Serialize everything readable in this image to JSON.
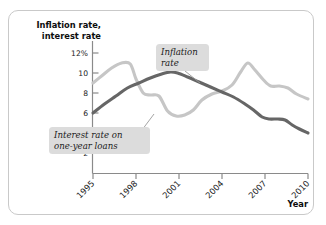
{
  "figure": {
    "frame_color": "#c9c9c9",
    "background": "#ffffff"
  },
  "chart_data": {
    "type": "line",
    "title": "",
    "ylabel_line1": "Inflation rate,",
    "ylabel_line2": "interest rate",
    "xlabel": "Year",
    "grid": false,
    "legend": "annotations",
    "xlim": [
      1995,
      2010
    ],
    "ylim": [
      0,
      12
    ],
    "ytick_labels": [
      "12%",
      "10",
      "8",
      "6",
      "4",
      "2"
    ],
    "ytick_values": [
      12,
      10,
      8,
      6,
      4,
      2
    ],
    "xtick_labels": [
      "1995",
      "1998",
      "2001",
      "2004",
      "2007",
      "2010"
    ],
    "xtick_values": [
      1995,
      1998,
      2001,
      2004,
      2007,
      2010
    ],
    "series": [
      {
        "name": "Inflation rate",
        "color": "#c6c6c6",
        "x": [
          1995,
          1995.6,
          1996.3,
          1997.0,
          1997.6,
          1998.0,
          1998.5,
          1999.0,
          1999.6,
          2000.2,
          2000.8,
          2001.4,
          2002.0,
          2002.6,
          2003.3,
          2004.0,
          2004.7,
          2005.3,
          2005.8,
          2006.3,
          2006.9,
          2007.4,
          2008.0,
          2008.6,
          2009.2,
          2010.0
        ],
        "values": [
          9.0,
          9.7,
          10.5,
          11.0,
          10.9,
          9.4,
          8.0,
          7.8,
          7.7,
          6.2,
          5.7,
          5.8,
          6.3,
          7.3,
          7.9,
          8.2,
          8.8,
          10.1,
          11.0,
          10.3,
          9.3,
          8.7,
          8.7,
          8.5,
          7.9,
          7.4
        ]
      },
      {
        "name": "Interest rate on one-year loans",
        "color": "#666666",
        "x": [
          1995,
          1995.8,
          1996.6,
          1997.4,
          1998.2,
          1999.0,
          1999.8,
          2000.4,
          2000.9,
          2001.6,
          2002.4,
          2003.2,
          2004.0,
          2004.8,
          2005.6,
          2006.2,
          2006.8,
          2007.3,
          2007.9,
          2008.4,
          2008.9,
          2009.4,
          2010.0
        ],
        "values": [
          6.0,
          6.9,
          7.7,
          8.5,
          9.0,
          9.5,
          9.9,
          10.1,
          10.0,
          9.6,
          9.1,
          8.6,
          8.1,
          7.6,
          6.9,
          6.3,
          5.6,
          5.4,
          5.4,
          5.3,
          4.8,
          4.4,
          4.0
        ]
      }
    ],
    "annotations": [
      {
        "id": "inflation-callout",
        "line1": "Inflation",
        "line2": "rate",
        "box_color": "#dcdcdc"
      },
      {
        "id": "interest-callout",
        "line1": "Interest rate on",
        "line2": "one-year loans",
        "box_color": "#dcdcdc"
      }
    ]
  }
}
